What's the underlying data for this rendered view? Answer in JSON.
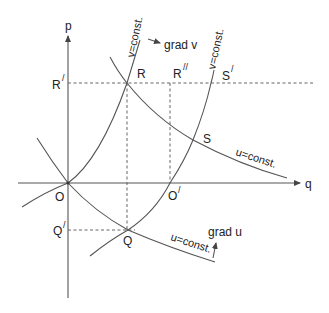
{
  "diagram": {
    "axes": {
      "p_label": "p",
      "q_label": "q"
    },
    "points": {
      "O": "O",
      "O_prime": "O",
      "O_prime_mark": "/",
      "R": "R",
      "R_prime": "R",
      "R_prime_mark": "/",
      "R_double_prime": "R",
      "R_double_prime_mark": "//",
      "S": "S",
      "S_prime": "S",
      "S_prime_mark": "/",
      "Q": "Q",
      "Q_prime": "Q",
      "Q_prime_mark": "/"
    },
    "curve_labels": {
      "v_const_left": "v=const.",
      "v_const_right": "v=const.",
      "u_const_upper": "u=const.",
      "u_const_lower": "u=const."
    },
    "gradients": {
      "grad_v": "grad v",
      "grad_u": "grad u"
    },
    "colors": {
      "line": "#555555",
      "text": "#222222",
      "background": "#ffffff"
    }
  }
}
